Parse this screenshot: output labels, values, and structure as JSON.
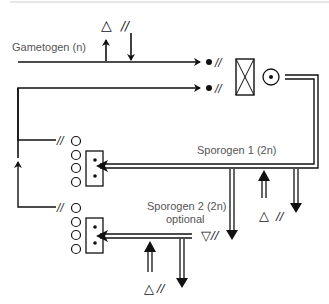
{
  "diagram": {
    "colors": {
      "line": "#111111",
      "label": "#555555",
      "top_rule": "#cccccc"
    },
    "labels": {
      "gametogen": "Gametogen (n)",
      "sporogen1": "Sporogen 1 (2n)",
      "sporogen2_line1": "Sporogen 2 (2n)",
      "sporogen2_line2": "optional"
    },
    "symbols": {
      "triangle_up": "△",
      "triangle_down": "▽",
      "double_slash": "//"
    },
    "nodes": [
      {
        "id": "gametogen-line",
        "label": "Gametogen (n)"
      },
      {
        "id": "gametes",
        "description": "two dots with // markers"
      },
      {
        "id": "fusion-box",
        "description": "box with X"
      },
      {
        "id": "zygote",
        "description": "circle with dot"
      },
      {
        "id": "sporogen1",
        "label": "Sporogen 1 (2n)"
      },
      {
        "id": "sporogen2",
        "label": "Sporogen 2 (2n) optional"
      },
      {
        "id": "spore-tetrad-1",
        "description": "four circles and box with two dots"
      },
      {
        "id": "spore-tetrad-2",
        "description": "four circles and box with two dots"
      }
    ]
  }
}
